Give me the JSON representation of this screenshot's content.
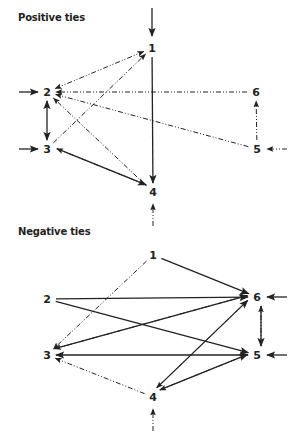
{
  "positive": {
    "title": "Positive ties",
    "nodes": [
      {
        "id": "1",
        "label": "1",
        "x": 152,
        "y": 48
      },
      {
        "id": "2",
        "label": "2",
        "x": 47,
        "y": 92
      },
      {
        "id": "3",
        "label": "3",
        "x": 47,
        "y": 149
      },
      {
        "id": "4",
        "label": "4",
        "x": 153,
        "y": 192
      },
      {
        "id": "5",
        "label": "5",
        "x": 257,
        "y": 149
      },
      {
        "id": "6",
        "label": "6",
        "x": 256,
        "y": 92
      }
    ],
    "edges": [
      {
        "from": "1",
        "to": "4",
        "style": "solid"
      },
      {
        "from": "2",
        "to": "3",
        "style": "solid",
        "bidirectional": true
      },
      {
        "from": "3",
        "to": "4",
        "style": "solid"
      },
      {
        "from": "2",
        "to": "1",
        "style": "dash",
        "bidirectional": true
      },
      {
        "from": "3",
        "to": "1",
        "style": "dash"
      },
      {
        "from": "6",
        "to": "2",
        "style": "dash"
      },
      {
        "from": "5",
        "to": "2",
        "style": "dash"
      },
      {
        "from": "4",
        "to": "2",
        "style": "dash"
      },
      {
        "from": "4",
        "to": "3",
        "style": "dash"
      },
      {
        "from": "5",
        "to": "6",
        "style": "dash"
      }
    ],
    "external": [
      {
        "to": "1",
        "dir": "down",
        "style": "solid"
      },
      {
        "to": "2",
        "dir": "right",
        "style": "solid"
      },
      {
        "to": "3",
        "dir": "right",
        "style": "solid"
      },
      {
        "to": "4",
        "dir": "up",
        "style": "dash"
      },
      {
        "to": "5",
        "dir": "left",
        "style": "dash"
      }
    ]
  },
  "negative": {
    "title": "Negative ties",
    "nodes": [
      {
        "id": "1",
        "label": "1",
        "x": 153,
        "y": 255
      },
      {
        "id": "2",
        "label": "2",
        "x": 47,
        "y": 299
      },
      {
        "id": "3",
        "label": "3",
        "x": 47,
        "y": 355
      },
      {
        "id": "4",
        "label": "4",
        "x": 153,
        "y": 397
      },
      {
        "id": "5",
        "label": "5",
        "x": 257,
        "y": 355
      },
      {
        "id": "6",
        "label": "6",
        "x": 257,
        "y": 297
      }
    ],
    "edges": [
      {
        "from": "1",
        "to": "6",
        "style": "solid"
      },
      {
        "from": "1",
        "to": "3",
        "style": "dash"
      },
      {
        "from": "2",
        "to": "6",
        "style": "solid"
      },
      {
        "from": "2",
        "to": "5",
        "style": "solid"
      },
      {
        "from": "3",
        "to": "6",
        "style": "solid"
      },
      {
        "from": "6",
        "to": "3",
        "style": "dash"
      },
      {
        "from": "3",
        "to": "5",
        "style": "solid",
        "bidirectional": true
      },
      {
        "from": "4",
        "to": "3",
        "style": "dash"
      },
      {
        "from": "4",
        "to": "6",
        "style": "solid"
      },
      {
        "from": "6",
        "to": "4",
        "style": "dash"
      },
      {
        "from": "4",
        "to": "5",
        "style": "solid"
      },
      {
        "from": "5",
        "to": "4",
        "style": "dash"
      },
      {
        "from": "6",
        "to": "5",
        "style": "solid"
      },
      {
        "from": "5",
        "to": "6",
        "style": "dash"
      }
    ],
    "external": [
      {
        "to": "6",
        "dir": "left",
        "style": "solid"
      },
      {
        "to": "5",
        "dir": "left",
        "style": "solid"
      },
      {
        "to": "4",
        "dir": "up",
        "style": "dash"
      }
    ]
  }
}
